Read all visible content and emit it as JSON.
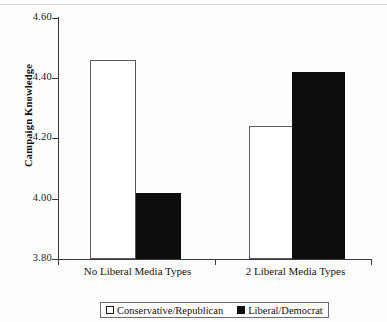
{
  "chart_data": {
    "type": "bar",
    "title": "",
    "xlabel": "",
    "ylabel": "Campaign Knowledge",
    "ylim": [
      3.8,
      4.6
    ],
    "ytick_labels": [
      "4.60",
      "4.40",
      "4.20",
      "4.00",
      "3.80"
    ],
    "ytick_values": [
      4.6,
      4.4,
      4.2,
      4.0,
      3.8
    ],
    "grid": false,
    "legend_position": "bottom",
    "categories": [
      "No Liberal Media Types",
      "2 Liberal Media Types"
    ],
    "series": [
      {
        "name": "Conservative/Republican",
        "style": "open",
        "color": "#ffffff",
        "edge_color": "#5a5a5a",
        "values": [
          4.46,
          4.24
        ]
      },
      {
        "name": "Liberal/Democrat",
        "style": "solid",
        "color": "#0d0d0d",
        "edge_color": "#0d0d0d",
        "values": [
          4.02,
          4.42
        ]
      }
    ]
  },
  "axis": {
    "y_title": "Campaign Knowledge",
    "ticks": [
      {
        "label": "4.60",
        "value": 4.6
      },
      {
        "label": "4.40",
        "value": 4.4
      },
      {
        "label": "4.20",
        "value": 4.2
      },
      {
        "label": "4.00",
        "value": 4.0
      },
      {
        "label": "3.80",
        "value": 3.8
      }
    ]
  },
  "x_categories": [
    {
      "label": "No Liberal Media Types"
    },
    {
      "label": "2 Liberal Media Types"
    }
  ],
  "legend": {
    "entries": [
      {
        "label": "Conservative/Republican",
        "style": "open"
      },
      {
        "label": "Liberal/Democrat",
        "style": "solid"
      }
    ]
  }
}
